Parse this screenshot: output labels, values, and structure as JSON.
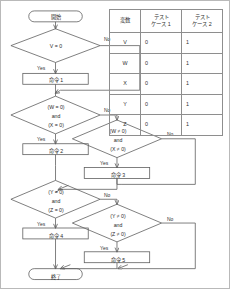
{
  "diagram": {
    "title_terminal_start": "開始",
    "title_terminal_end": "終了",
    "yes_label": "Yes",
    "no_label": "No",
    "nodes": {
      "start": "開始",
      "d1": "V = 0",
      "p1": "命令 1",
      "d2_l1": "(W = 0)",
      "d2_l2": "and",
      "d2_l3": "(X = 0)",
      "p2": "命令 2",
      "d3_l1": "(W ≠ 0)",
      "d3_l2": "and",
      "d3_l3": "(X ≠ 0)",
      "p3": "命令 3",
      "d4_l1": "(Y = 0)",
      "d4_l2": "and",
      "d4_l3": "(Z = 0)",
      "p4": "命令 4",
      "d5_l1": "(Y ≠ 0)",
      "d5_l2": "and",
      "d5_l3": "(Z ≠ 0)",
      "p5": "命令 5",
      "end": "終了"
    },
    "edge_labels": {
      "e1_no": "No",
      "e1_yes": "Yes",
      "e2_no": "No",
      "e2_yes": "Yes",
      "e3_no": "No",
      "e3_yes": "Yes",
      "e4_no": "No",
      "e4_yes": "Yes",
      "e5_no": "No",
      "e5_yes": "Yes"
    }
  },
  "table": {
    "headers": {
      "variable": "変数",
      "case1_line1": "テスト",
      "case1_line2": "ケース 1",
      "case2_line1": "テスト",
      "case2_line2": "ケース 2"
    },
    "rows": [
      {
        "variable": "V",
        "case1": "0",
        "case2": "1"
      },
      {
        "variable": "W",
        "case1": "0",
        "case2": "1"
      },
      {
        "variable": "X",
        "case1": "0",
        "case2": "1"
      },
      {
        "variable": "Y",
        "case1": "0",
        "case2": "1"
      },
      {
        "variable": "Z",
        "case1": "0",
        "case2": "1"
      }
    ]
  },
  "style": {
    "stroke": "#5f5f5f",
    "frame": "#b9b9b9",
    "text": "#2b2b2b"
  }
}
